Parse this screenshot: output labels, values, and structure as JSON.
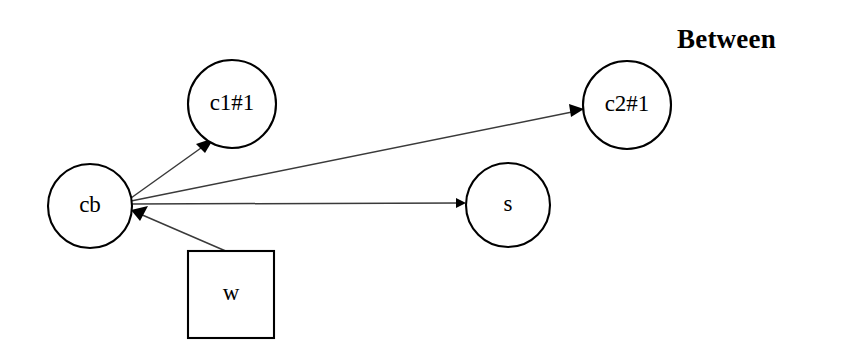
{
  "title": {
    "text": "Between",
    "x": 677,
    "y": 24
  },
  "canvas": {
    "width": 849,
    "height": 359,
    "background": "#ffffff"
  },
  "colors": {
    "stroke": "#000000",
    "edge": "#3a3a3a",
    "fill": "#ffffff",
    "text": "#000000"
  },
  "nodes": [
    {
      "id": "cb",
      "label": "cb",
      "shape": "circle",
      "cx": 90,
      "cy": 206,
      "r": 42
    },
    {
      "id": "c1",
      "label": "c1#1",
      "shape": "circle",
      "cx": 232,
      "cy": 104,
      "r": 44
    },
    {
      "id": "c2",
      "label": "c2#1",
      "shape": "circle",
      "cx": 627,
      "cy": 105,
      "r": 44
    },
    {
      "id": "s",
      "label": "s",
      "shape": "circle",
      "cx": 508,
      "cy": 205,
      "r": 42
    },
    {
      "id": "w",
      "label": "w",
      "shape": "rect",
      "x": 188,
      "y": 251,
      "width": 86,
      "height": 87
    }
  ],
  "edges": [
    {
      "id": "cb-to-c1",
      "from": "cb",
      "to": "c1",
      "directed": true,
      "x1": 131,
      "y1": 198,
      "x2": 206,
      "y2": 141
    },
    {
      "id": "cb-to-c2",
      "from": "cb",
      "to": "c2",
      "directed": true,
      "x1": 131,
      "y1": 201,
      "x2": 581,
      "y2": 110
    },
    {
      "id": "cb-to-s",
      "from": "cb",
      "to": "s",
      "directed": true,
      "x1": 131,
      "y1": 204,
      "x2": 463,
      "y2": 203
    },
    {
      "id": "w-to-cb",
      "from": "w",
      "to": "cb",
      "directed": true,
      "x1": 228,
      "y1": 252,
      "x2": 131,
      "y2": 210
    }
  ]
}
